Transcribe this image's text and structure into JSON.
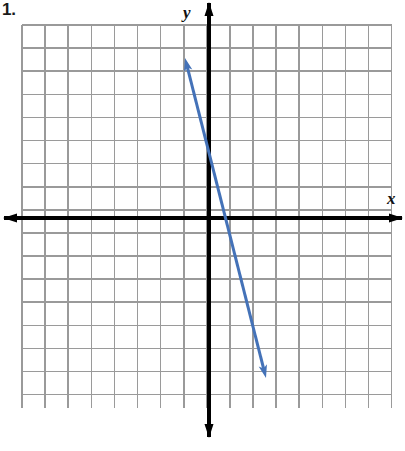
{
  "page": {
    "problem_number": "1.",
    "background_color": "#ffffff"
  },
  "figure": {
    "name": "coordinate-plane-with-line",
    "grid": {
      "color": "#9a9a9a",
      "cell_px": 23.1,
      "columns": 16,
      "rows": 16,
      "left_px": 22,
      "top_px": 25,
      "right_px": 392,
      "bottom_px": 408
    },
    "axes": {
      "color": "#000000",
      "origin_px": {
        "x": 209,
        "y": 218
      },
      "x_axis_label": "x",
      "y_axis_label": "y",
      "x_axis_arrows": "both",
      "y_axis_arrows": "both",
      "x_range": [
        -8,
        8
      ],
      "y_range": [
        -8,
        8
      ],
      "tick_labels_shown": false
    }
  },
  "chart_data": {
    "type": "line",
    "title": "",
    "xlabel": "x",
    "ylabel": "y",
    "xlim": [
      -8,
      8
    ],
    "ylim": [
      -8,
      8
    ],
    "grid": true,
    "legend": false,
    "series": [
      {
        "name": "line",
        "color": "#4472b8",
        "slope": -3,
        "y_intercept": 3,
        "x_intercept": 1,
        "equation": "y = -3x + 3",
        "arrows": "both",
        "points": [
          {
            "x": -1,
            "y": 6
          },
          {
            "x": 0,
            "y": 3
          },
          {
            "x": 1,
            "y": 0
          },
          {
            "x": 2.45,
            "y": -4.35
          }
        ],
        "endpoint_px": [
          {
            "x": 185,
            "y": 58
          },
          {
            "x": 266,
            "y": 378
          }
        ]
      }
    ]
  }
}
